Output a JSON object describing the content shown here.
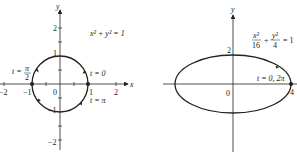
{
  "colors": {
    "ink": "#222222",
    "background": "#ffffff"
  },
  "left_plot": {
    "equation": "x² + y² = 1",
    "axis_x_label": "x",
    "axis_y_label": "y",
    "x_ticks": [
      "−2",
      "−1",
      "0",
      "1",
      "2"
    ],
    "y_ticks": [
      "2",
      "1",
      "−1",
      "−2"
    ],
    "annotations": {
      "t0": "t = 0",
      "tpi": "t = π",
      "tpi2_prefix": "t =",
      "tpi2_num": "π",
      "tpi2_den": "2"
    }
  },
  "right_plot": {
    "equation_x_num": "x²",
    "equation_x_den": "16",
    "equation_plus": "+",
    "equation_y_num": "y²",
    "equation_y_den": "4",
    "equation_rhs": "= 1",
    "axis_y_label": "y",
    "x_ticks": [
      "0",
      "4"
    ],
    "y_ticks": [
      "2"
    ],
    "annotations": {
      "t02pi": "t = 0, 2π"
    }
  }
}
